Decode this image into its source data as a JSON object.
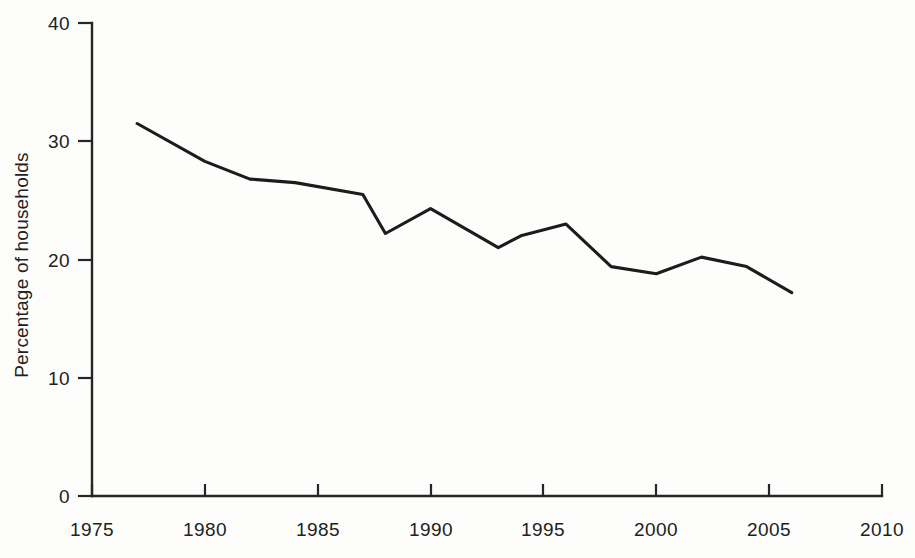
{
  "chart_data": {
    "type": "line",
    "title": "",
    "subtitle": "",
    "xlabel": "",
    "ylabel": "Percentage of households",
    "xlim": [
      1975,
      2010
    ],
    "ylim": [
      0,
      40
    ],
    "grid": false,
    "legend": null,
    "x_ticks": [
      1975,
      1980,
      1985,
      1990,
      1995,
      2000,
      2005,
      2010
    ],
    "x_tick_labels": [
      "1975",
      "1980",
      "1985",
      "1990",
      "1995",
      "2000",
      "2005",
      "2010"
    ],
    "y_ticks": [
      0,
      10,
      20,
      30,
      40
    ],
    "y_tick_labels": [
      "0",
      "10",
      "20",
      "30",
      "40"
    ],
    "series": [
      {
        "name": "Percentage of households",
        "color": "#1c1c1c",
        "x": [
          1977,
          1980,
          1982,
          1984,
          1987,
          1988,
          1990,
          1993,
          1994,
          1996,
          1998,
          2000,
          2002,
          2004,
          2006
        ],
        "values": [
          31.5,
          28.3,
          26.8,
          26.5,
          25.5,
          22.2,
          24.3,
          21.0,
          22.0,
          23.0,
          19.4,
          18.8,
          20.2,
          19.4,
          17.2
        ]
      }
    ]
  },
  "axis": {
    "y_title": "Percentage of households"
  }
}
